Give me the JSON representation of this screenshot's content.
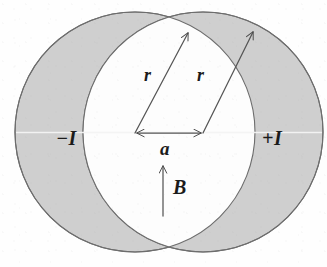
{
  "figure": {
    "width": 327,
    "height": 267,
    "background_color": "#fefefe"
  },
  "colors": {
    "shading": "#cfcfcf",
    "shading_edge": "#c4c4c4",
    "outline": "#6d6d6d",
    "lens_fill": "#fdfdfd",
    "ink": "#1b1b1b",
    "arrow": "#555555",
    "guideline": "#f4f4f4"
  },
  "geometry": {
    "left_circle": {
      "cx": 135,
      "cy": 132,
      "r": 120,
      "name": "negative-current-cylinder"
    },
    "right_circle": {
      "cx": 203,
      "cy": 132,
      "r": 120,
      "name": "positive-current-cylinder"
    },
    "top_intersection": {
      "x": 169,
      "y": 33
    },
    "bottom_intersection": {
      "x": 169,
      "y": 231
    },
    "separation_a": 68
  },
  "labels": {
    "current_negative": "−I",
    "current_positive": "+I",
    "radius_left": "r",
    "radius_right": "r",
    "separation": "a",
    "field": "B"
  },
  "vectors": [
    {
      "name": "radius-vector-left",
      "label": "r",
      "from": {
        "x": 135,
        "y": 133
      },
      "to": {
        "x": 188,
        "y": 33
      },
      "arrowhead": "end"
    },
    {
      "name": "radius-vector-right",
      "label": "r",
      "from": {
        "x": 203,
        "y": 133
      },
      "to": {
        "x": 253,
        "y": 32
      },
      "arrowhead": "end"
    },
    {
      "name": "separation-vector",
      "label": "a",
      "from": {
        "x": 135,
        "y": 133
      },
      "to": {
        "x": 203,
        "y": 133
      },
      "arrowhead": "both"
    },
    {
      "name": "magnetic-field-vector",
      "label": "B",
      "from": {
        "x": 163,
        "y": 216
      },
      "to": {
        "x": 163,
        "y": 166
      },
      "arrowhead": "end"
    }
  ],
  "label_positions": {
    "current_negative": {
      "x": 56,
      "y": 128
    },
    "current_positive": {
      "x": 262,
      "y": 128
    },
    "radius_left": {
      "x": 144,
      "y": 66
    },
    "radius_right": {
      "x": 197,
      "y": 66
    },
    "separation": {
      "x": 160,
      "y": 139
    },
    "field": {
      "x": 173,
      "y": 177
    }
  }
}
